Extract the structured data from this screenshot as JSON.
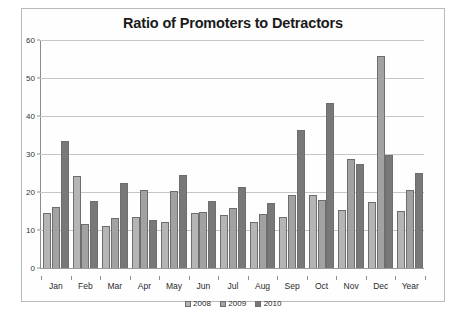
{
  "chart_data": {
    "type": "bar",
    "title": "Ratio of Promoters to Detractors",
    "xlabel": "",
    "ylabel": "",
    "ylim": [
      0,
      60
    ],
    "ytick_step": 10,
    "yticks": [
      0,
      10,
      20,
      30,
      40,
      50,
      60
    ],
    "grid": true,
    "legend_position": "bottom",
    "categories": [
      "Jan",
      "Feb",
      "Mar",
      "Apr",
      "May",
      "Jun",
      "Jul",
      "Aug",
      "Sep",
      "Oct",
      "Nov",
      "Dec",
      "Year"
    ],
    "series": [
      {
        "name": "2008",
        "color": "#b5b5b5",
        "values": [
          14.5,
          24.3,
          11.0,
          13.3,
          12.2,
          14.6,
          14.0,
          12.2,
          13.3,
          19.2,
          15.2,
          17.3,
          15.0
        ]
      },
      {
        "name": "2009",
        "color": "#a2a2a2",
        "values": [
          16.1,
          11.5,
          13.2,
          20.6,
          20.3,
          14.8,
          15.7,
          14.1,
          19.2,
          17.8,
          28.8,
          55.7,
          20.6
        ]
      },
      {
        "name": "2010",
        "color": "#787878",
        "values": [
          33.3,
          17.6,
          22.4,
          12.7,
          24.6,
          17.7,
          21.4,
          17.2,
          36.3,
          43.5,
          27.5,
          29.7,
          25.1
        ]
      }
    ]
  },
  "legend": {
    "items": [
      {
        "label": "2008"
      },
      {
        "label": "2009"
      },
      {
        "label": "2010"
      }
    ]
  }
}
